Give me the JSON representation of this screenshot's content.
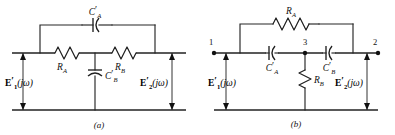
{
  "figure": {
    "kind": "circuit-diagram-pair",
    "background_color": "#ffffff",
    "line_color": "#1f1f1f",
    "panels": [
      {
        "id": "panel-a",
        "caption": "(a)",
        "topology": "bridged-T / twin-T section with series resistors and bridging capacitor",
        "components": [
          {
            "name": "C'_A",
            "type": "capacitor",
            "orientation": "horizontal",
            "position": "top bridging branch",
            "label_main": "C",
            "label_prime": "′",
            "label_sub": "A"
          },
          {
            "name": "R_A",
            "type": "resistor",
            "orientation": "horizontal",
            "position": "left series arm",
            "label_main": "R",
            "label_prime": "",
            "label_sub": "A"
          },
          {
            "name": "R_B",
            "type": "resistor",
            "orientation": "horizontal",
            "position": "right series arm",
            "label_main": "R",
            "label_prime": "",
            "label_sub": "B"
          },
          {
            "name": "C'_B",
            "type": "capacitor",
            "orientation": "vertical",
            "position": "shunt branch to ground",
            "label_main": "C",
            "label_prime": "′",
            "label_sub": "B"
          }
        ],
        "ports": [
          {
            "name": "input-voltage",
            "label_main": "E",
            "label_prime": "′",
            "label_sub": "1",
            "label_arg": "(jω)",
            "side": "left",
            "arrow": "double"
          },
          {
            "name": "output-voltage",
            "label_main": "E",
            "label_prime": "′",
            "label_sub": "2",
            "label_arg": "(jω)",
            "side": "right",
            "arrow": "double"
          }
        ]
      },
      {
        "id": "panel-b",
        "caption": "(b)",
        "topology": "dual bridged-T with series capacitors, bridging resistor and shunt resistor",
        "components": [
          {
            "name": "R_A",
            "type": "resistor",
            "orientation": "horizontal",
            "position": "top bridging branch",
            "label_main": "R",
            "label_prime": "",
            "label_sub": "A"
          },
          {
            "name": "C'_A",
            "type": "capacitor",
            "orientation": "horizontal",
            "position": "left series arm",
            "label_main": "C",
            "label_prime": "′",
            "label_sub": "A"
          },
          {
            "name": "C'_B",
            "type": "capacitor",
            "orientation": "horizontal",
            "position": "right series arm",
            "label_main": "C",
            "label_prime": "′",
            "label_sub": "B"
          },
          {
            "name": "R_B",
            "type": "resistor",
            "orientation": "vertical",
            "position": "shunt branch to ground",
            "label_main": "R",
            "label_prime": "",
            "label_sub": "B"
          }
        ],
        "nodes": [
          {
            "name": "node-1",
            "label": "1",
            "position": "left input terminal"
          },
          {
            "name": "node-3",
            "label": "3",
            "position": "middle junction"
          },
          {
            "name": "node-2",
            "label": "2",
            "position": "right output terminal"
          }
        ],
        "ports": [
          {
            "name": "input-voltage",
            "label_main": "E",
            "label_prime": "′",
            "label_sub": "1",
            "label_arg": "(jω)",
            "side": "left",
            "arrow": "double"
          },
          {
            "name": "output-voltage",
            "label_main": "E",
            "label_prime": "′",
            "label_sub": "2",
            "label_arg": "(jω)",
            "side": "right",
            "arrow": "double"
          }
        ]
      }
    ]
  },
  "labels": {
    "a": {
      "cap_top": {
        "main": "C",
        "prime": "′",
        "sub": "A"
      },
      "res_left": {
        "main": "R",
        "prime": "",
        "sub": "A"
      },
      "res_right": {
        "main": "R",
        "prime": "",
        "sub": "B"
      },
      "cap_shunt": {
        "main": "C",
        "prime": "′",
        "sub": "B"
      },
      "v_in": {
        "main": "E",
        "prime": "′",
        "sub": "1",
        "arg": "(jω)"
      },
      "v_out": {
        "main": "E",
        "prime": "′",
        "sub": "2",
        "arg": "(jω)"
      },
      "caption": "(a)"
    },
    "b": {
      "res_top": {
        "main": "R",
        "prime": "",
        "sub": "A"
      },
      "cap_left": {
        "main": "C",
        "prime": "′",
        "sub": "A"
      },
      "cap_right": {
        "main": "C",
        "prime": "′",
        "sub": "B"
      },
      "res_shunt": {
        "main": "R",
        "prime": "",
        "sub": "B"
      },
      "v_in": {
        "main": "E",
        "prime": "′",
        "sub": "1",
        "arg": "(jω)"
      },
      "v_out": {
        "main": "E",
        "prime": "′",
        "sub": "2",
        "arg": "(jω)"
      },
      "node1": "1",
      "node3": "3",
      "node2": "2",
      "caption": "(b)"
    }
  }
}
